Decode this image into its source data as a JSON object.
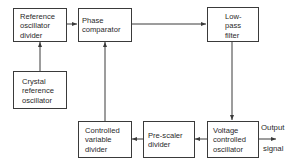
{
  "diagram": {
    "type": "block-diagram",
    "blocks": [
      {
        "id": "ref_divider",
        "label": "Reference\noscillator\ndivider"
      },
      {
        "id": "phase_comp",
        "label": "Phase\ncomparator"
      },
      {
        "id": "lpf",
        "label": "Low-\npass\nfilter"
      },
      {
        "id": "crystal",
        "label": "Crystal\nreference\noscillator"
      },
      {
        "id": "cvd",
        "label": "Controlled\nvariable\ndivider"
      },
      {
        "id": "prescaler",
        "label": "Pre-scaler\ndivider"
      },
      {
        "id": "vco",
        "label": "Voltage\ncontrolled\noscillator"
      }
    ],
    "connections": [
      {
        "from": "crystal",
        "to": "ref_divider"
      },
      {
        "from": "ref_divider",
        "to": "phase_comp"
      },
      {
        "from": "phase_comp",
        "to": "lpf"
      },
      {
        "from": "lpf",
        "to": "vco"
      },
      {
        "from": "vco",
        "to": "prescaler"
      },
      {
        "from": "prescaler",
        "to": "cvd"
      },
      {
        "from": "cvd",
        "to": "phase_comp"
      },
      {
        "from": "vco",
        "to": "output"
      }
    ],
    "output": {
      "line1": "Output",
      "line2": "signal"
    },
    "line_color": "#3a3a3a"
  }
}
